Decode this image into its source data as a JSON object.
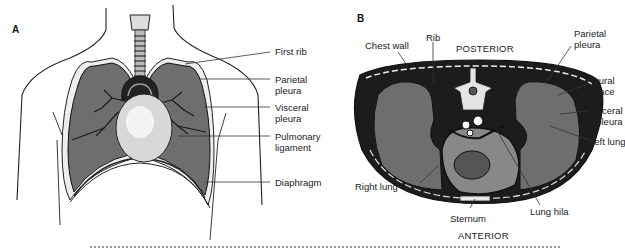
{
  "panel_a": {
    "letter": "A",
    "labels": {
      "first_rib": "First rib",
      "parietal_pleura_1": "Parietal",
      "parietal_pleura_2": "pleura",
      "visceral_pleura_1": "Visceral",
      "visceral_pleura_2": "pleura",
      "pulmonary_ligament_1": "Pulmonary",
      "pulmonary_ligament_2": "ligament",
      "diaphragm": "Diaphragm"
    }
  },
  "panel_b": {
    "letter": "B",
    "orientation": {
      "top": "POSTERIOR",
      "bottom": "ANTERIOR"
    },
    "labels": {
      "chest_wall": "Chest wall",
      "rib": "Rib",
      "parietal_pleura_1": "Parietal",
      "parietal_pleura_2": "pleura",
      "pleural_space_1": "Pleural",
      "pleural_space_2": "space",
      "visceral_pleura_1": "Visceral",
      "visceral_pleura_2": "pleura",
      "left_lung": "Left lung",
      "right_lung": "Right lung",
      "sternum": "Sternum",
      "lung_hila": "Lung hila"
    }
  },
  "colors": {
    "lung_fill": "#6e6e6e",
    "outline": "#1a1a1a",
    "background": "#ffffff"
  }
}
